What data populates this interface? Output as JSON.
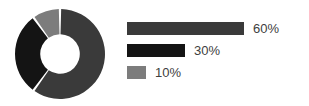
{
  "chart_data": {
    "type": "pie",
    "variant": "donut",
    "title": "",
    "subtitle": "",
    "xlabel": "",
    "ylabel": "",
    "grid": false,
    "legend_position": "right",
    "legend_style": "proportional-bars",
    "start_angle_deg": 0,
    "direction": "clockwise",
    "inner_radius_ratio": 0.44,
    "slice_gap_deg": 3,
    "labels": [
      "60%",
      "30%",
      "10%"
    ],
    "values": [
      60,
      30,
      10
    ],
    "colors": [
      "#3a3a3a",
      "#141414",
      "#7c7c7c"
    ],
    "slices": [
      {
        "label": "60%",
        "value": 60,
        "color": "#3a3a3a",
        "start_deg": 0,
        "end_deg": 216
      },
      {
        "label": "30%",
        "value": 30,
        "color": "#141414",
        "start_deg": 216,
        "end_deg": 324
      },
      {
        "label": "10%",
        "value": 10,
        "color": "#7c7c7c",
        "start_deg": 324,
        "end_deg": 360
      }
    ]
  },
  "legend": {
    "items": [
      {
        "label": "60%",
        "value": 60,
        "color": "#3a3a3a",
        "bar_width_px": 117
      },
      {
        "label": "30%",
        "value": 30,
        "color": "#141414",
        "bar_width_px": 58
      },
      {
        "label": "10%",
        "value": 10,
        "color": "#7c7c7c",
        "bar_width_px": 19
      }
    ]
  },
  "canvas": {
    "background": "#ffffff",
    "text_color": "#404040"
  }
}
